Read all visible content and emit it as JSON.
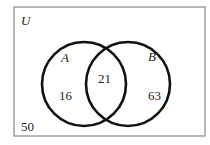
{
  "diagram": {
    "type": "venn",
    "universe_label": "U",
    "sets": [
      {
        "label": "A",
        "only_count": "16"
      },
      {
        "label": "B",
        "only_count": "63"
      }
    ],
    "intersection_count": "21",
    "outside_count": "50"
  }
}
